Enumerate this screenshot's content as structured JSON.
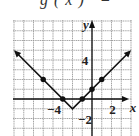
{
  "caption": "g(x) =",
  "chart_data": {
    "type": "line",
    "xlabel": "x",
    "ylabel": "y",
    "xlim": [
      -8,
      4
    ],
    "ylim": [
      -4,
      8
    ],
    "grid": true,
    "x_tick_labels": [
      {
        "value": -4,
        "label": "−4"
      },
      {
        "value": 2,
        "label": "2"
      }
    ],
    "y_tick_labels": [
      {
        "value": 4,
        "label": "4"
      },
      {
        "value": -2,
        "label": "−2"
      }
    ],
    "series": [
      {
        "name": "g(x)",
        "shape": "V (absolute value)",
        "vertex": [
          -2,
          -1
        ],
        "points": [
          [
            -5,
            2
          ],
          [
            -3,
            0
          ],
          [
            -2,
            -1
          ],
          [
            -1,
            0
          ],
          [
            0,
            1
          ],
          [
            1,
            2
          ]
        ],
        "arrows_to": [
          [
            -8,
            5
          ],
          [
            4,
            5
          ]
        ]
      }
    ]
  }
}
